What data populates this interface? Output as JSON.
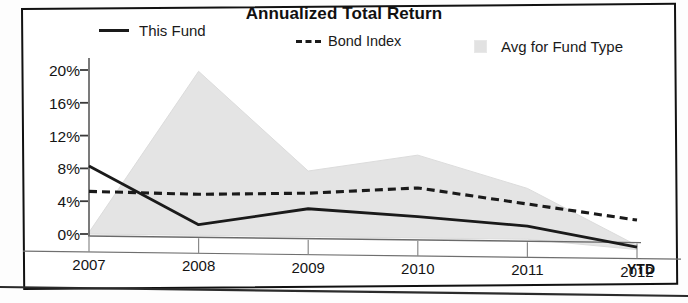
{
  "chart_data": {
    "type": "line",
    "title": "Annualized Total Return",
    "xlabel": "",
    "ylabel": "",
    "x": [
      "2007",
      "2008",
      "2009",
      "2010",
      "2011",
      "2012 YTD"
    ],
    "categories": [
      "2007",
      "2008",
      "2009",
      "2010",
      "2011",
      "2012"
    ],
    "xtick_labels": [
      "2007",
      "2008",
      "2009",
      "2010",
      "2011",
      "2012"
    ],
    "xtick_suffix": "YTD",
    "ytick_labels": [
      "20%",
      "16%",
      "12%",
      "8%",
      "4%",
      "0%"
    ],
    "ytick_values": [
      20,
      16,
      12,
      8,
      4,
      0
    ],
    "ylim": [
      -2,
      21
    ],
    "grid": false,
    "legend_position": "top",
    "series": [
      {
        "name": "This Fund",
        "style": "solid",
        "color": "#1a1a1a",
        "values": [
          8.3,
          1.3,
          3.4,
          2.6,
          1.6,
          -0.8
        ]
      },
      {
        "name": "Bond Index",
        "style": "dashed",
        "color": "#1a1a1a",
        "values": [
          5.2,
          5.0,
          5.3,
          6.1,
          4.3,
          2.5
        ]
      },
      {
        "name": "Avg for Fund Type",
        "style": "filled-band",
        "color": "#e4e4e4",
        "upper": [
          0.2,
          20.0,
          8.0,
          10.1,
          6.2,
          -0.6
        ],
        "lower": [
          0.0,
          0.0,
          0.0,
          0.0,
          0.0,
          -1.1
        ],
        "values": [
          0.2,
          20.0,
          8.0,
          10.1,
          6.2,
          -0.6
        ]
      }
    ]
  },
  "legend": {
    "items": [
      {
        "label": "This Fund",
        "marker": "solid-line"
      },
      {
        "label": "Bond Index",
        "marker": "dashed-line",
        "prefix": "---"
      },
      {
        "label": "Avg for Fund Type",
        "marker": "gray-swatch"
      }
    ]
  },
  "colors": {
    "band": "#e4e4e4",
    "line": "#1a1a1a",
    "axis": "#4a4a4a",
    "frame": "#111111"
  }
}
